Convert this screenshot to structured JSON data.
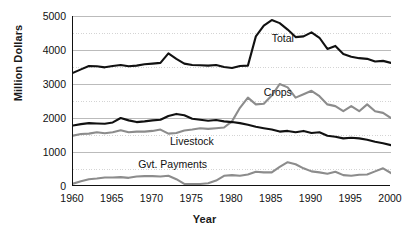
{
  "chart_data": {
    "type": "line",
    "title": "",
    "xlabel": "Year",
    "ylabel": "Million Dollars",
    "xlim": [
      1960,
      2000
    ],
    "ylim": [
      0,
      5000
    ],
    "grid": true,
    "grid_interval": 500,
    "legend_position": "inline-annotations",
    "ytick_labels": [
      "0",
      "1000",
      "2000",
      "3000",
      "4000",
      "5000"
    ],
    "ytick_values": [
      0,
      1000,
      2000,
      3000,
      4000,
      5000
    ],
    "xtick_labels": [
      "1960",
      "1965",
      "1970",
      "1975",
      "1980",
      "1985",
      "1990",
      "1995",
      "2000"
    ],
    "xtick_values": [
      1960,
      1965,
      1970,
      1975,
      1980,
      1985,
      1990,
      1995,
      2000
    ],
    "x": [
      1960,
      1961,
      1962,
      1963,
      1964,
      1965,
      1966,
      1967,
      1968,
      1969,
      1970,
      1971,
      1972,
      1973,
      1974,
      1975,
      1976,
      1977,
      1978,
      1979,
      1980,
      1981,
      1982,
      1983,
      1984,
      1985,
      1986,
      1987,
      1988,
      1989,
      1990,
      1991,
      1992,
      1993,
      1994,
      1995,
      1996,
      1997,
      1998,
      1999,
      2000
    ],
    "series": [
      {
        "name": "Total",
        "color": "#111111",
        "label": "Total",
        "values": [
          3330,
          3430,
          3530,
          3520,
          3490,
          3530,
          3560,
          3520,
          3540,
          3580,
          3600,
          3620,
          3900,
          3740,
          3600,
          3560,
          3550,
          3540,
          3560,
          3500,
          3470,
          3530,
          3540,
          4400,
          4720,
          4880,
          4790,
          4600,
          4380,
          4400,
          4520,
          4360,
          4030,
          4120,
          3880,
          3800,
          3760,
          3740,
          3660,
          3680,
          3620
        ]
      },
      {
        "name": "Crops",
        "color": "#8c8c8c",
        "label": "Crops",
        "values": [
          1480,
          1530,
          1540,
          1580,
          1550,
          1580,
          1640,
          1580,
          1600,
          1600,
          1620,
          1660,
          1540,
          1560,
          1630,
          1660,
          1700,
          1680,
          1700,
          1720,
          1900,
          2300,
          2600,
          2400,
          2420,
          2660,
          3000,
          2900,
          2600,
          2700,
          2800,
          2640,
          2400,
          2350,
          2200,
          2350,
          2200,
          2400,
          2200,
          2150,
          2000
        ]
      },
      {
        "name": "Livestock",
        "color": "#111111",
        "label": "Livestock",
        "values": [
          1780,
          1820,
          1850,
          1840,
          1830,
          1870,
          2000,
          1930,
          1880,
          1900,
          1930,
          1950,
          2060,
          2120,
          2080,
          1980,
          1950,
          1920,
          1940,
          1900,
          1880,
          1850,
          1800,
          1740,
          1700,
          1660,
          1600,
          1620,
          1580,
          1620,
          1560,
          1580,
          1480,
          1450,
          1400,
          1420,
          1400,
          1360,
          1300,
          1260,
          1200
        ]
      },
      {
        "name": "Gvt. Payments",
        "color": "#8c8c8c",
        "label": "Gvt. Payments",
        "values": [
          70,
          140,
          200,
          220,
          250,
          250,
          260,
          240,
          280,
          290,
          290,
          280,
          300,
          200,
          60,
          60,
          60,
          80,
          160,
          300,
          320,
          300,
          340,
          420,
          400,
          400,
          560,
          700,
          640,
          520,
          430,
          400,
          360,
          420,
          320,
          300,
          330,
          340,
          430,
          520,
          380
        ]
      }
    ],
    "annotations": [
      {
        "text": "Total",
        "x": 1985,
        "y": 4330
      },
      {
        "text": "Crops",
        "x": 1984,
        "y": 2740
      },
      {
        "text": "Livestock",
        "x": 1972.2,
        "y": 1300
      },
      {
        "text": "Gvt. Payments",
        "x": 1968.2,
        "y": 620
      }
    ]
  },
  "axes": {
    "y_title": "Million Dollars",
    "x_title": "Year"
  }
}
